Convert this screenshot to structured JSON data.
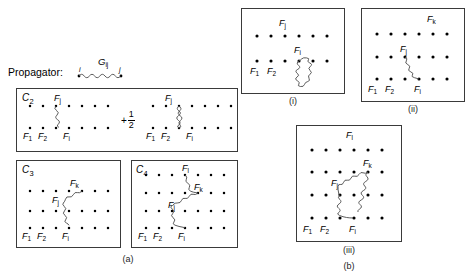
{
  "figure": {
    "propagator": {
      "text": "Propagator:",
      "symbol": "G",
      "symbol_sub": "ij",
      "end_label_left": "i",
      "end_label_right": "j"
    },
    "group_a": {
      "caption": "(a)",
      "panels": [
        {
          "id": "C2",
          "label": "C",
          "label_sub": "2",
          "rows": 2,
          "cols": 7,
          "terms": [
            {
              "coefficient": null,
              "line_style": "single-wave",
              "node_labels": [
                "F_j",
                "F_1",
                "F_2",
                "F_i"
              ]
            },
            {
              "coefficient": "+1/2",
              "coefficient_sign": "+",
              "coefficient_num": "1",
              "coefficient_den": "2",
              "line_style": "double-wave",
              "node_labels": [
                "F_j",
                "F_1",
                "F_2",
                "F_i"
              ]
            }
          ]
        },
        {
          "id": "C3",
          "label": "C",
          "label_sub": "3",
          "rows": 3,
          "cols": 7,
          "node_labels": [
            "F_k",
            "F_j",
            "F_1",
            "F_2",
            "F_i"
          ]
        },
        {
          "id": "C4",
          "label": "C",
          "label_sub": "4",
          "rows": 4,
          "cols": 7,
          "node_labels": [
            "F_l",
            "F_k",
            "F_j",
            "F_1",
            "F_2",
            "F_i"
          ]
        }
      ]
    },
    "group_b": {
      "caption": "(b)",
      "panels": [
        {
          "id": "i",
          "caption": "(i)",
          "rows": 2,
          "cols": 6,
          "node_labels": [
            "F_j",
            "F_i",
            "F_1",
            "F_2"
          ],
          "feature": "closed-blob-loop"
        },
        {
          "id": "ii",
          "caption": "(ii)",
          "rows": 3,
          "cols": 6,
          "node_labels": [
            "F_k",
            "F_j",
            "F_1",
            "F_2",
            "F_i"
          ],
          "feature": "single-wave"
        },
        {
          "id": "iii",
          "caption": "(iii)",
          "rows": 4,
          "cols": 6,
          "node_labels": [
            "F_l",
            "F_k",
            "F_j",
            "F_1",
            "F_2",
            "F_i"
          ],
          "feature": "closed-triangle-loop"
        }
      ]
    },
    "labels": {
      "Fj": "F",
      "Fj_sub": "j",
      "Fk": "F",
      "Fk_sub": "k",
      "Fl": "F",
      "Fl_sub": "l",
      "Fi": "F",
      "Fi_sub": "i",
      "F1": "F",
      "F1_sub": "1",
      "F2": "F",
      "F2_sub": "2"
    },
    "colors": {
      "ink": "#000000",
      "panel_border": "#3a3a3a",
      "wave": "#4a4a4a",
      "background": "#ffffff"
    }
  }
}
